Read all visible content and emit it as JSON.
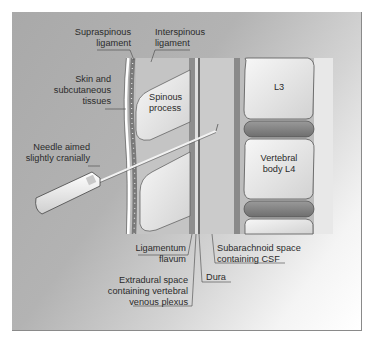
{
  "figure": {
    "colors": {
      "background": "#b0b0b0",
      "bone": "#e6e6e6",
      "ligament": "#8f8f8f",
      "disc": "#7d7d7d",
      "csf": "#c9c9c9",
      "skin": "#ffffff"
    },
    "labels": {
      "supraspinous": [
        "Supraspinous",
        "ligament"
      ],
      "interspinous": [
        "Interspinous",
        "ligament"
      ],
      "skin": [
        "Skin and",
        "subcutaneous",
        "tissues"
      ],
      "spinous_process": [
        "Spinous",
        "process"
      ],
      "needle": [
        "Needle aimed",
        "slightly cranially"
      ],
      "l3": "L3",
      "vertebral_body": [
        "Vertebral",
        "body L4"
      ],
      "ligamentum_flavum": [
        "Ligamentum",
        "flavum"
      ],
      "subarachnoid": [
        "Subarachnoid space",
        "containing CSF"
      ],
      "extradural": [
        "Extradural space",
        "containing vertebral",
        "venous plexus"
      ],
      "dura": "Dura"
    }
  }
}
